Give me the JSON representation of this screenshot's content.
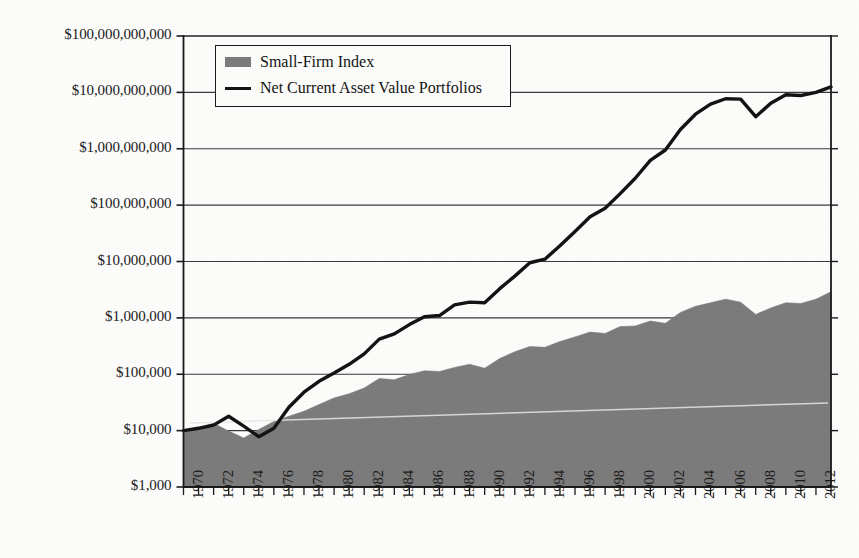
{
  "chart_data": {
    "type": "area",
    "title": "",
    "subtitle": "",
    "xlabel": "",
    "ylabel": "",
    "scale": "log",
    "grid": true,
    "legend_position": "top-left",
    "xlim": [
      1970,
      2013
    ],
    "ylim": [
      1000,
      100000000000
    ],
    "ytick_labels": [
      "$100,000,000,000",
      "$10,000,000,000",
      "$1,000,000,000",
      "$100,000,000",
      "$10,000,000",
      "$1,000,000",
      "$100,000",
      "$10,000",
      "$1,000"
    ],
    "ytick_values": [
      100000000000,
      10000000000,
      1000000000,
      100000000,
      10000000,
      1000000,
      100000,
      10000,
      1000
    ],
    "xtick_labels": [
      "1970",
      "1972",
      "1974",
      "1976",
      "1978",
      "1980",
      "1982",
      "1984",
      "1986",
      "1988",
      "1990",
      "1992",
      "1994",
      "1996",
      "1998",
      "2000",
      "2002",
      "2004",
      "2006",
      "2008",
      "2010",
      "2012"
    ],
    "x": [
      1970,
      1971,
      1972,
      1973,
      1974,
      1975,
      1976,
      1977,
      1978,
      1979,
      1980,
      1981,
      1982,
      1983,
      1984,
      1985,
      1986,
      1987,
      1988,
      1989,
      1990,
      1991,
      1992,
      1993,
      1994,
      1995,
      1996,
      1997,
      1998,
      1999,
      2000,
      2001,
      2002,
      2003,
      2004,
      2005,
      2006,
      2007,
      2008,
      2009,
      2010,
      2011,
      2012,
      2013
    ],
    "series": [
      {
        "name": "Small-Firm Index",
        "color": "#7c7c7c",
        "kind": "area",
        "values": [
          10000,
          11500,
          13500,
          9800,
          7400,
          10500,
          14500,
          18000,
          22000,
          29000,
          38000,
          45000,
          57000,
          84000,
          80000,
          99000,
          115000,
          112000,
          132000,
          150000,
          128000,
          190000,
          250000,
          310000,
          300000,
          380000,
          460000,
          560000,
          530000,
          700000,
          720000,
          880000,
          800000,
          1250000,
          1600000,
          1850000,
          2150000,
          1900000,
          1150000,
          1500000,
          1850000,
          1800000,
          2150000,
          2900000
        ]
      },
      {
        "name": "Net Current Asset Value Portfolios",
        "color": "#141414",
        "kind": "line",
        "values": [
          10000,
          11000,
          12500,
          18000,
          12000,
          7800,
          11000,
          26000,
          48000,
          75000,
          105000,
          150000,
          230000,
          420000,
          520000,
          760000,
          1050000,
          1100000,
          1700000,
          1900000,
          1850000,
          3300000,
          5500000,
          9500000,
          11000000,
          19000000,
          34000000,
          62000000,
          88000000,
          160000000,
          300000000,
          620000000,
          950000000,
          2200000000,
          4100000000,
          6200000000,
          7700000000,
          7600000000,
          3700000000,
          6400000000,
          9100000000,
          8800000000,
          10000000000,
          12500000000
        ]
      }
    ],
    "legend": [
      {
        "label": "Small-Firm Index",
        "marker": "area-swatch"
      },
      {
        "label": "Net Current Asset Value Portfolios",
        "marker": "line-swatch"
      }
    ],
    "colors": {
      "area_fill": "#7c7c7c",
      "line": "#141414",
      "axis": "#1b1b1b",
      "grid": "#3a3a3a",
      "background": "#fdfdfc"
    }
  }
}
